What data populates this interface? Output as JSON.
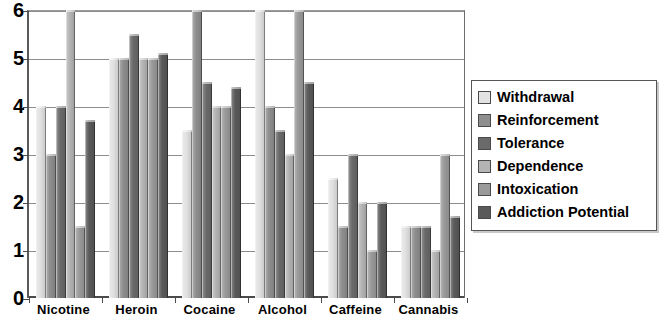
{
  "chart_data": {
    "type": "bar",
    "title": "",
    "xlabel": "",
    "ylabel": "",
    "ylim": [
      0,
      6
    ],
    "yticks": [
      0,
      1,
      2,
      3,
      4,
      5,
      6
    ],
    "ytick_labels": [
      "0",
      "1",
      "2",
      "3",
      "4",
      "5",
      "6"
    ],
    "grid": true,
    "legend_position": "right",
    "categories": [
      "Nicotine",
      "Heroin",
      "Cocaine",
      "Alcohol",
      "Caffeine",
      "Cannabis"
    ],
    "series": [
      {
        "name": "Withdrawal",
        "color": "#e2e2e2",
        "values": [
          4.0,
          5.0,
          3.5,
          6.0,
          2.5,
          1.5
        ]
      },
      {
        "name": "Reinforcement",
        "color": "#8e8e8e",
        "values": [
          3.0,
          5.0,
          6.0,
          4.0,
          1.5,
          1.5
        ]
      },
      {
        "name": "Tolerance",
        "color": "#6a6a6a",
        "values": [
          4.0,
          5.5,
          4.5,
          3.5,
          3.0,
          1.5
        ]
      },
      {
        "name": "Dependence",
        "color": "#b4b4b4",
        "values": [
          6.0,
          5.0,
          4.0,
          3.0,
          2.0,
          1.0
        ]
      },
      {
        "name": "Intoxication",
        "color": "#9a9a9a",
        "values": [
          1.5,
          5.0,
          4.0,
          6.0,
          1.0,
          3.0
        ]
      },
      {
        "name": "Addiction Potential",
        "color": "#5a5a5a",
        "values": [
          3.7,
          5.1,
          4.4,
          4.5,
          2.0,
          1.7
        ]
      }
    ]
  },
  "legend": {
    "items": [
      {
        "label": "Withdrawal"
      },
      {
        "label": "Reinforcement"
      },
      {
        "label": "Tolerance"
      },
      {
        "label": "Dependence"
      },
      {
        "label": "Intoxication"
      },
      {
        "label": "Addiction Potential"
      }
    ]
  },
  "axes": {
    "y_tick_labels": [
      "6",
      "5",
      "4",
      "3",
      "2",
      "1",
      "0"
    ],
    "x_tick_labels": [
      "Nicotine",
      "Heroin",
      "Cocaine",
      "Alcohol",
      "Caffeine",
      "Cannabis"
    ]
  }
}
